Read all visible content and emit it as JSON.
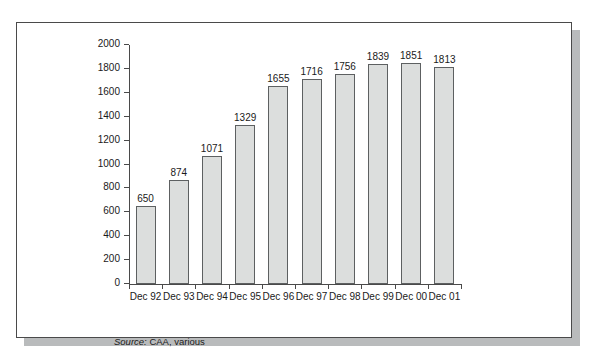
{
  "figure": {
    "source_prefix": "Source:",
    "source_text": " CAA, various",
    "frame_color": "#4a4a4a",
    "shadow_color": "#b9bbbc",
    "bar_fill": "#dcdedd",
    "bar_stroke": "#5d6061"
  },
  "chart_data": {
    "type": "bar",
    "title": "",
    "xlabel": "",
    "ylabel": "",
    "categories": [
      "Dec 92",
      "Dec 93",
      "Dec 94",
      "Dec 95",
      "Dec 96",
      "Dec 97",
      "Dec 98",
      "Dec 99",
      "Dec 00",
      "Dec 01"
    ],
    "values": [
      650,
      874,
      1071,
      1329,
      1655,
      1716,
      1756,
      1839,
      1851,
      1813
    ],
    "value_labels": [
      "650",
      "874",
      "1071",
      "1329",
      "1655",
      "1716",
      "1756",
      "1839",
      "1851",
      "1813"
    ],
    "ylim": [
      0,
      2000
    ],
    "ytick_values": [
      0,
      200,
      400,
      600,
      800,
      1000,
      1200,
      1400,
      1600,
      1800,
      2000
    ],
    "ytick_labels": [
      "0",
      "200",
      "400",
      "600",
      "800",
      "1000",
      "1200",
      "1400",
      "1600",
      "1800",
      "2000"
    ],
    "grid": false,
    "legend": false,
    "data_labels": true,
    "source": "Source: CAA, various"
  }
}
